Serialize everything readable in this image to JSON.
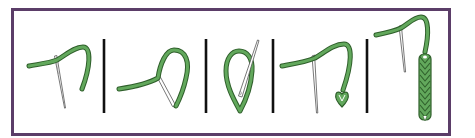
{
  "figure": {
    "title": "Lazy daisy / chain stitch step-by-step",
    "colors": {
      "background": "#ffffff",
      "frame": "#5b3d68",
      "divider": "#111111",
      "thread": "#62a85c",
      "thread_outline": "#2f5f2b",
      "needle_fill": "#ffffff",
      "needle_stroke": "#555555"
    },
    "steps": [
      {
        "index": 1,
        "label": "Bring needle up, thread exits fabric"
      },
      {
        "index": 2,
        "label": "Form loop, insert needle back at exit point"
      },
      {
        "index": 3,
        "label": "Bring needle up inside loop"
      },
      {
        "index": 4,
        "label": "Pull through, tack loop to form first chain"
      },
      {
        "index": 5,
        "label": "Repeat to form a chain of stitches"
      }
    ],
    "dividers": 4
  }
}
